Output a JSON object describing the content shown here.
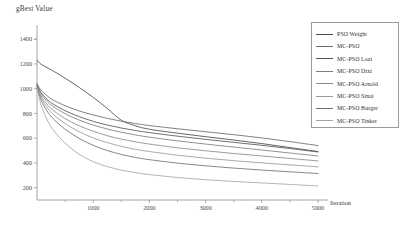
{
  "chart_data": {
    "type": "line",
    "title": "",
    "xlabel": "Iteration",
    "ylabel": "gBest Value",
    "xlim": [
      0,
      5000
    ],
    "ylim": [
      100,
      1450
    ],
    "grid": false,
    "legend_position": "top-right",
    "xticks": [
      1000,
      2000,
      3000,
      4000,
      5000
    ],
    "yticks": [
      200,
      400,
      600,
      800,
      1000,
      1200,
      1400
    ],
    "x": [
      0,
      50,
      100,
      200,
      300,
      500,
      750,
      1000,
      1250,
      1500,
      1750,
      2000,
      2500,
      3000,
      3500,
      4000,
      4500,
      5000
    ],
    "series": [
      {
        "name": "PSO Weight",
        "color": "#4a4a4a",
        "values": [
          1230,
          1205,
          1190,
          1165,
          1140,
          1085,
          1010,
          930,
          840,
          745,
          700,
          672,
          640,
          612,
          585,
          556,
          524,
          492
        ]
      },
      {
        "name": "MC-PSO",
        "color": "#6a6a6a",
        "values": [
          1040,
          1000,
          975,
          935,
          905,
          862,
          820,
          788,
          760,
          737,
          718,
          702,
          676,
          652,
          628,
          602,
          572,
          540
        ]
      },
      {
        "name": "MC-PSO Lozi",
        "color": "#555555",
        "values": [
          1035,
          985,
          952,
          905,
          872,
          822,
          774,
          736,
          706,
          682,
          662,
          645,
          616,
          590,
          566,
          542,
          516,
          488
        ]
      },
      {
        "name": "MC-PSO Dixi",
        "color": "#7d7d7d",
        "values": [
          1030,
          975,
          940,
          888,
          852,
          798,
          746,
          706,
          674,
          648,
          626,
          608,
          578,
          552,
          528,
          504,
          480,
          456
        ]
      },
      {
        "name": "MC-PSO Arnold",
        "color": "#8a8a8a",
        "values": [
          1025,
          962,
          920,
          862,
          820,
          758,
          700,
          656,
          620,
          592,
          570,
          552,
          522,
          498,
          476,
          456,
          436,
          416
        ]
      },
      {
        "name": "MC-PSO Sinai",
        "color": "#9a9a9a",
        "values": [
          1020,
          950,
          902,
          836,
          788,
          718,
          652,
          602,
          564,
          534,
          510,
          492,
          462,
          438,
          418,
          400,
          384,
          368
        ]
      },
      {
        "name": "MC-PSO Burger",
        "color": "#707070",
        "values": [
          1015,
          935,
          880,
          805,
          752,
          672,
          598,
          542,
          500,
          468,
          444,
          426,
          398,
          376,
          358,
          342,
          328,
          314
        ]
      },
      {
        "name": "MC-PSO Tinker",
        "color": "#a5a5a5",
        "values": [
          1010,
          905,
          832,
          730,
          660,
          560,
          470,
          410,
          370,
          342,
          322,
          306,
          282,
          264,
          250,
          238,
          226,
          214
        ]
      }
    ]
  },
  "axes": {
    "y_title": "gBest Value",
    "x_title": "Iteration",
    "ytick_labels": [
      "1400",
      "1200",
      "1000",
      "800",
      "600",
      "400",
      "200"
    ],
    "xtick_labels": [
      "1000",
      "2000",
      "3000",
      "4000",
      "5000"
    ]
  },
  "legend": {
    "entries": [
      {
        "label": "PSO Weight"
      },
      {
        "label": "MC-PSO"
      },
      {
        "label": "MC-PSO Lozi"
      },
      {
        "label": "MC-PSO Dixi"
      },
      {
        "label": "MC-PSO Arnold"
      },
      {
        "label": "MC-PSO Sinai"
      },
      {
        "label": "MC-PSO Burger"
      },
      {
        "label": "MC-PSO Tinker"
      }
    ]
  }
}
